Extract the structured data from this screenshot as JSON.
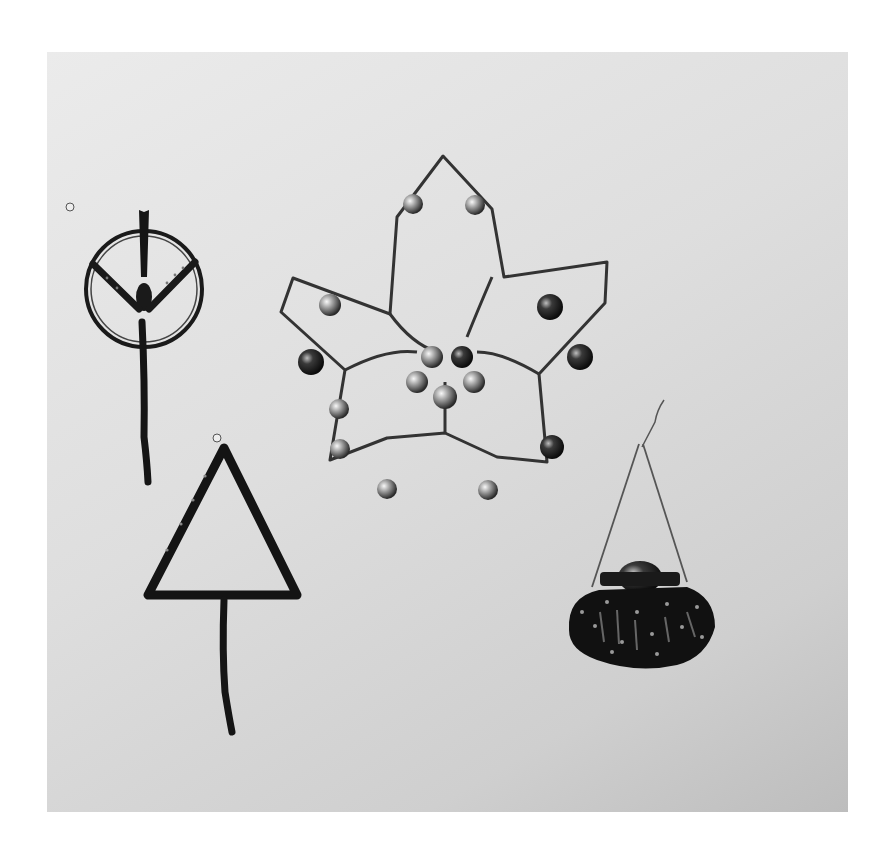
{
  "image": {
    "description": "Black-and-white photograph of four beaded wire ornaments on a light grey background",
    "background_colors": {
      "light": "#ebebeb",
      "dark": "#bdbdbd",
      "page": "#ffffff"
    },
    "objects": [
      {
        "name": "circle-ornament",
        "shape": "ring with Y-shaped beaded arms and hanging beaded stem"
      },
      {
        "name": "triangle-ornament",
        "shape": "beaded triangle with hanging beaded stem"
      },
      {
        "name": "star-ornament",
        "shape": "five-pointed beaded star with silver and dark round beads and central bead cluster"
      },
      {
        "name": "fan-ornament",
        "shape": "scalloped beaded fan hanging from a triangular wire hanger"
      }
    ]
  }
}
